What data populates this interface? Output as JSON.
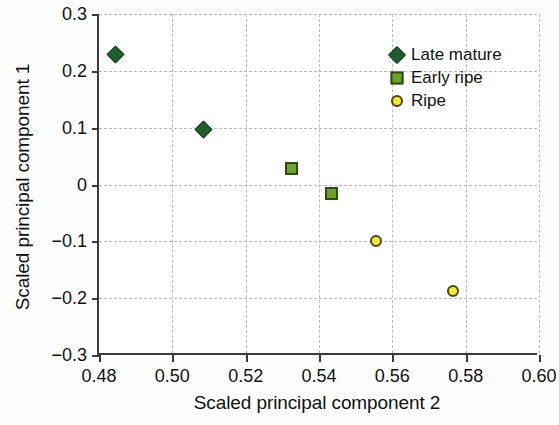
{
  "chart_data": {
    "type": "scatter",
    "title": "",
    "xlabel": "Scaled principal component 2",
    "ylabel": "Scaled principal component 1",
    "xlim": [
      0.48,
      0.6
    ],
    "ylim": [
      -0.3,
      0.3
    ],
    "xticks": [
      "0.48",
      "0.50",
      "0.52",
      "0.54",
      "0.56",
      "0.58",
      "0.60"
    ],
    "xtick_values": [
      0.48,
      0.5,
      0.52,
      0.54,
      0.56,
      0.58,
      0.6
    ],
    "yticks": [
      "0.3",
      "0.2",
      "0.1",
      "0",
      "−0.1",
      "−0.2",
      "−0.3"
    ],
    "ytick_values": [
      0.3,
      0.2,
      0.1,
      0,
      -0.1,
      -0.2,
      -0.3
    ],
    "grid": true,
    "legend_position": "top-right",
    "series": [
      {
        "name": "Late mature",
        "marker": "diamond",
        "color": "#1f5c2e",
        "edge_color": "#143a1e",
        "points": [
          {
            "x": 0.4845,
            "y": 0.228
          },
          {
            "x": 0.5085,
            "y": 0.096
          }
        ]
      },
      {
        "name": "Early ripe",
        "marker": "square",
        "color": "#6ea32b",
        "edge_color": "#2f4a17",
        "points": [
          {
            "x": 0.5325,
            "y": 0.028
          },
          {
            "x": 0.5435,
            "y": -0.016
          }
        ]
      },
      {
        "name": "Ripe",
        "marker": "circle",
        "color": "#f2e636",
        "edge_color": "#4a4410",
        "points": [
          {
            "x": 0.5555,
            "y": -0.1
          },
          {
            "x": 0.5765,
            "y": -0.188
          }
        ]
      }
    ]
  }
}
